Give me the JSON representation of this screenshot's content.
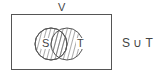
{
  "diagram": {
    "universe_label": "V",
    "set_a_label": "S",
    "set_b_label": "T",
    "caption": "S ∪ T",
    "shaded_region": "union",
    "colors": {
      "line": "#555555",
      "background": "#ffffff"
    }
  }
}
